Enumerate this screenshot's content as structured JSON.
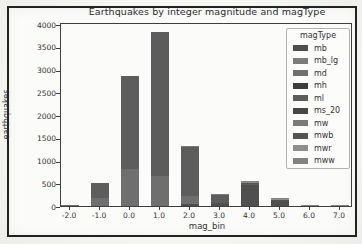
{
  "figure": {
    "title": "Earthquakes by integer magnitude and magType",
    "xlabel": "mag_bin",
    "ylabel": "earthquakes",
    "legend_title": "magType"
  },
  "chart_data": {
    "type": "bar",
    "stacked": true,
    "title": "Earthquakes by integer magnitude and magType",
    "xlabel": "mag_bin",
    "ylabel": "earthquakes",
    "categories": [
      "-2.0",
      "-1.0",
      "0.0",
      "1.0",
      "2.0",
      "3.0",
      "4.0",
      "5.0",
      "6.0",
      "7.0"
    ],
    "y_ticks": [
      0,
      500,
      1000,
      1500,
      2000,
      2500,
      3000,
      3500,
      4000
    ],
    "ylim": [
      0,
      4000
    ],
    "grid": false,
    "legend": {
      "title": "magType",
      "position": "upper right",
      "entries": [
        "mb",
        "mb_lg",
        "md",
        "mh",
        "ml",
        "ms_20",
        "mw",
        "mwb",
        "mwr",
        "mww"
      ]
    },
    "bar_totals": [
      15,
      500,
      2860,
      3830,
      1320,
      270,
      540,
      180,
      10,
      5
    ],
    "series": [
      {
        "name": "mb",
        "color": "#4f4f4f",
        "values": [
          0,
          0,
          0,
          0,
          40,
          70,
          470,
          120,
          0,
          0
        ]
      },
      {
        "name": "mb_lg",
        "color": "#7c7c7c",
        "values": [
          0,
          0,
          0,
          0,
          0,
          0,
          0,
          0,
          0,
          0
        ]
      },
      {
        "name": "md",
        "color": "#6f6f6f",
        "values": [
          15,
          180,
          820,
          660,
          170,
          0,
          0,
          0,
          0,
          0
        ]
      },
      {
        "name": "mh",
        "color": "#3e3e3e",
        "values": [
          0,
          0,
          0,
          0,
          0,
          0,
          0,
          0,
          0,
          0
        ]
      },
      {
        "name": "ml",
        "color": "#5d5d5d",
        "values": [
          0,
          320,
          2040,
          3170,
          1090,
          190,
          20,
          0,
          0,
          0
        ]
      },
      {
        "name": "ms_20",
        "color": "#484848",
        "values": [
          0,
          0,
          0,
          0,
          0,
          0,
          0,
          0,
          0,
          0
        ]
      },
      {
        "name": "mw",
        "color": "#7a7a7a",
        "values": [
          0,
          0,
          0,
          0,
          20,
          10,
          10,
          10,
          0,
          0
        ]
      },
      {
        "name": "mwb",
        "color": "#545454",
        "values": [
          0,
          0,
          0,
          0,
          0,
          0,
          10,
          10,
          0,
          0
        ]
      },
      {
        "name": "mwr",
        "color": "#8e8e8e",
        "values": [
          0,
          0,
          0,
          0,
          0,
          0,
          20,
          10,
          0,
          0
        ]
      },
      {
        "name": "mww",
        "color": "#828282",
        "values": [
          0,
          0,
          0,
          0,
          0,
          0,
          10,
          30,
          10,
          5
        ]
      }
    ]
  }
}
